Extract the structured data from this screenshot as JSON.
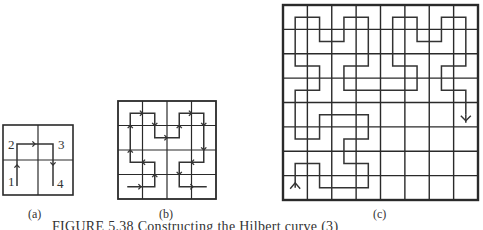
{
  "figure": {
    "caption": "FIGURE 5.38  Constructing the Hilbert curve (3)",
    "style": {
      "grid_color": "#2a2a2a",
      "curve_color": "#333333",
      "background": "#ffffff"
    },
    "panels": [
      {
        "id": "a",
        "label": "(a)",
        "label_pos": [
          28,
          207
        ],
        "grid": {
          "x": 3,
          "y": 125,
          "size": 70,
          "cells": 2,
          "outer_width": 1.6,
          "inner_width": 1.2
        },
        "curve": {
          "points": [
            [
              17,
              186
            ],
            [
              17,
              144
            ],
            [
              53,
              144
            ],
            [
              53,
              186
            ]
          ],
          "start_marker": "none",
          "mid_arrows": [
            [
              0,
              "up"
            ],
            [
              1,
              "right"
            ],
            [
              2,
              "down"
            ]
          ],
          "end_marker": "none"
        },
        "vertex_labels": [
          {
            "text": "1",
            "x": 8,
            "y": 174
          },
          {
            "text": "2",
            "x": 8,
            "y": 137
          },
          {
            "text": "3",
            "x": 58,
            "y": 137
          },
          {
            "text": "4",
            "x": 57,
            "y": 176
          }
        ]
      },
      {
        "id": "b",
        "label": "(b)",
        "label_pos": [
          159,
          207
        ],
        "grid": {
          "x": 118,
          "y": 101,
          "size": 98,
          "cells": 4,
          "outer_width": 1.8,
          "inner_width": 1.2
        },
        "curve": {
          "cell_path": [
            [
              0,
              3
            ],
            [
              1,
              3
            ],
            [
              1,
              2
            ],
            [
              0,
              2
            ],
            [
              0,
              1
            ],
            [
              0,
              0
            ],
            [
              1,
              0
            ],
            [
              1,
              1
            ],
            [
              2,
              1
            ],
            [
              2,
              0
            ],
            [
              3,
              0
            ],
            [
              3,
              1
            ],
            [
              3,
              2
            ],
            [
              2,
              2
            ],
            [
              2,
              3
            ],
            [
              3,
              3
            ]
          ],
          "start_offset": [
            -3,
            0
          ],
          "end_offset": [
            3,
            0
          ],
          "arrows": true,
          "start_marker": "none",
          "end_marker": "none"
        }
      },
      {
        "id": "c",
        "label": "(c)",
        "label_pos": [
          373,
          207
        ],
        "grid": {
          "x": 283,
          "y": 5,
          "size": 195,
          "cells": 8,
          "outer_width": 2.4,
          "inner_width": 1.4
        },
        "curve": {
          "cell_path": [
            [
              0,
              7
            ],
            [
              0,
              6
            ],
            [
              1,
              6
            ],
            [
              1,
              7
            ],
            [
              2,
              7
            ],
            [
              3,
              7
            ],
            [
              3,
              6
            ],
            [
              2,
              6
            ],
            [
              2,
              5
            ],
            [
              3,
              5
            ],
            [
              3,
              4
            ],
            [
              2,
              4
            ],
            [
              1,
              4
            ],
            [
              1,
              5
            ],
            [
              0,
              5
            ],
            [
              0,
              4
            ],
            [
              0,
              3
            ],
            [
              1,
              3
            ],
            [
              1,
              2
            ],
            [
              0,
              2
            ],
            [
              0,
              1
            ],
            [
              0,
              0
            ],
            [
              1,
              0
            ],
            [
              1,
              1
            ],
            [
              2,
              1
            ],
            [
              2,
              0
            ],
            [
              3,
              0
            ],
            [
              3,
              1
            ],
            [
              3,
              2
            ],
            [
              2,
              2
            ],
            [
              2,
              3
            ],
            [
              3,
              3
            ],
            [
              4,
              3
            ],
            [
              5,
              3
            ],
            [
              5,
              2
            ],
            [
              4,
              2
            ],
            [
              4,
              1
            ],
            [
              4,
              0
            ],
            [
              5,
              0
            ],
            [
              5,
              1
            ],
            [
              6,
              1
            ],
            [
              6,
              0
            ],
            [
              7,
              0
            ],
            [
              7,
              1
            ],
            [
              7,
              2
            ],
            [
              6,
              2
            ],
            [
              6,
              3
            ],
            [
              7,
              3
            ],
            [
              7,
              4
            ]
          ],
          "arrows": false,
          "start_marker": "arrow-up",
          "end_marker": "arrow-down"
        }
      }
    ]
  }
}
